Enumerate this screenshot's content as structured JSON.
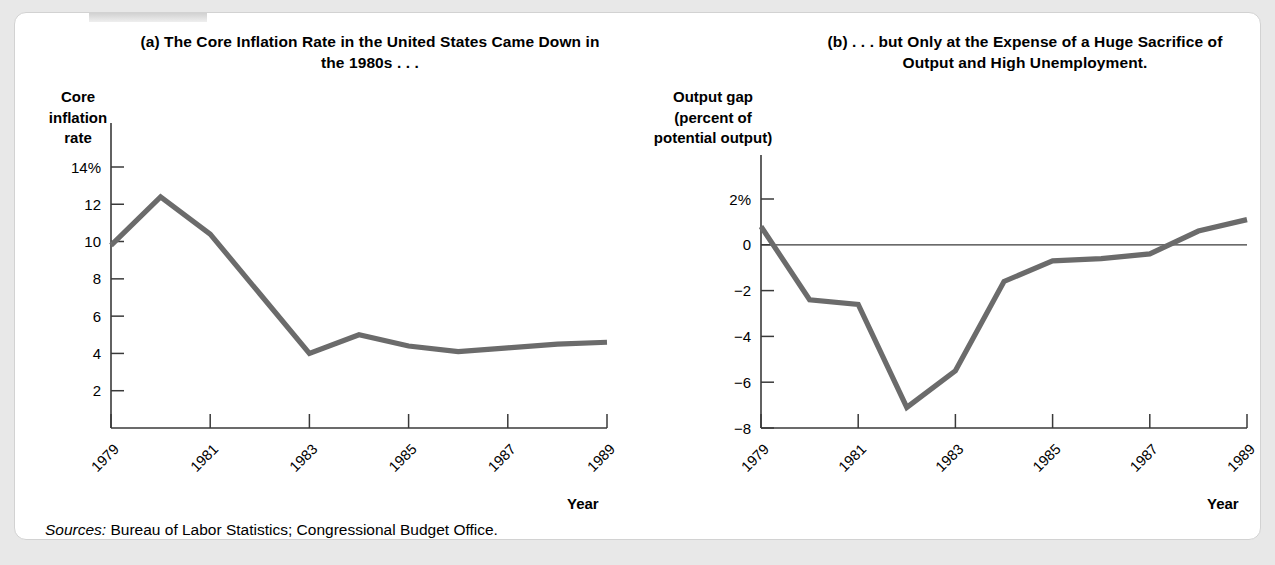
{
  "figure": {
    "sources_prefix": "Sources:",
    "sources_text": " Bureau of Labor Statistics; Congressional Budget Office.",
    "line_color": "#6b6b6b",
    "axis_color": "#3a3a3a",
    "panel_background": "#ffffff",
    "page_background": "#e8e8e8"
  },
  "panel_a": {
    "title": "(a) The Core Inflation Rate in the United States Came Down in the 1980s . . .",
    "y_axis_caption": "Core inflation rate",
    "x_axis_label": "Year"
  },
  "panel_b": {
    "title": "(b) . . . but Only at the Expense of a Huge Sacrifice of Output and High Unemployment.",
    "y_axis_caption": "Output gap (percent of potential output)",
    "x_axis_label": "Year"
  },
  "chart_data": [
    {
      "type": "line",
      "id": "core-inflation-rate",
      "title": "(a) The Core Inflation Rate in the United States Came Down in the 1980s . . .",
      "xlabel": "Year",
      "ylabel": "Core inflation rate",
      "x": [
        1979,
        1980,
        1981,
        1982,
        1983,
        1984,
        1985,
        1986,
        1987,
        1988,
        1989
      ],
      "values": [
        9.8,
        12.4,
        10.4,
        7.2,
        4.0,
        5.0,
        4.4,
        4.1,
        4.3,
        4.5,
        4.6
      ],
      "xlim": [
        1979,
        1989
      ],
      "ylim": [
        0,
        14
      ],
      "ytick_values": [
        14,
        12,
        10,
        8,
        6,
        4,
        2
      ],
      "ytick_labels": [
        "14%",
        "12",
        "10",
        "8",
        "6",
        "4",
        "2"
      ],
      "xtick_values": [
        1979,
        1981,
        1983,
        1985,
        1987,
        1989
      ],
      "xtick_labels": [
        "1979",
        "1981",
        "1983",
        "1985",
        "1987",
        "1989"
      ],
      "grid": false,
      "legend": "none",
      "zero_line": false
    },
    {
      "type": "line",
      "id": "output-gap",
      "title": "(b) . . . but Only at the Expense of a Huge Sacrifice of Output and High Unemployment.",
      "xlabel": "Year",
      "ylabel": "Output gap (percent of potential output)",
      "x": [
        1979,
        1980,
        1981,
        1982,
        1983,
        1984,
        1985,
        1986,
        1987,
        1988,
        1989
      ],
      "values": [
        0.8,
        -2.4,
        -2.6,
        -7.1,
        -5.5,
        -1.6,
        -0.7,
        -0.6,
        -0.4,
        0.6,
        1.1
      ],
      "xlim": [
        1979,
        1989
      ],
      "ylim": [
        -8,
        2
      ],
      "ytick_values": [
        2,
        0,
        -2,
        -4,
        -6,
        -8
      ],
      "ytick_labels": [
        "2%",
        "0",
        "−2",
        "−4",
        "−6",
        "−8"
      ],
      "xtick_values": [
        1979,
        1981,
        1983,
        1985,
        1987,
        1989
      ],
      "xtick_labels": [
        "1979",
        "1981",
        "1983",
        "1985",
        "1987",
        "1989"
      ],
      "grid": false,
      "legend": "none",
      "zero_line": true
    }
  ]
}
